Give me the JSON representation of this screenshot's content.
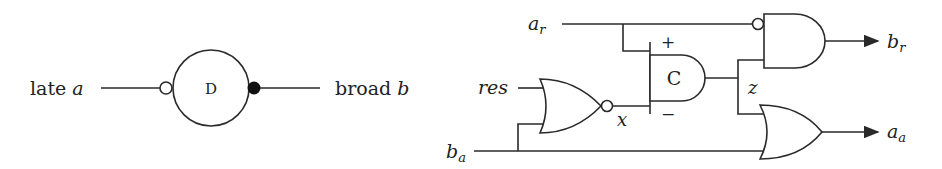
{
  "left_diagram": {
    "input_label_text": "late ",
    "input_label_var": "a",
    "element_label": "D",
    "output_label_text": "broad ",
    "output_label_var": "b"
  },
  "right_circuit": {
    "inputs": [
      {
        "name": "a",
        "sub": "r"
      },
      {
        "name": "res",
        "sub": ""
      },
      {
        "name": "b",
        "sub": "a"
      }
    ],
    "outputs": [
      {
        "name": "b",
        "sub": "r"
      },
      {
        "name": "a",
        "sub": "a"
      }
    ],
    "c_element_label": "C",
    "c_plus": "+",
    "c_minus": "−",
    "node_x": "x",
    "node_z": "z"
  }
}
